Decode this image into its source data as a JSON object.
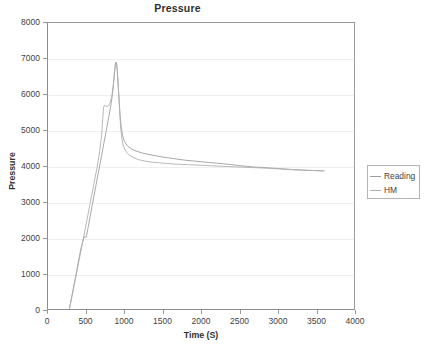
{
  "chart_data": {
    "type": "line",
    "title": "Pressure",
    "xlabel": "Time (S)",
    "ylabel": "Pressure",
    "xlim": [
      0,
      4000
    ],
    "ylim": [
      0,
      8000
    ],
    "xticks": [
      0,
      500,
      1000,
      1500,
      2000,
      2500,
      3000,
      3500,
      4000
    ],
    "yticks": [
      0,
      1000,
      2000,
      3000,
      4000,
      5000,
      6000,
      7000,
      8000
    ],
    "grid": "horizontal",
    "legend_position": "right",
    "series": [
      {
        "name": "Reading",
        "color": "#9e9e9e",
        "points": [
          [
            280,
            0
          ],
          [
            330,
            560
          ],
          [
            380,
            1120
          ],
          [
            430,
            1690
          ],
          [
            470,
            2010
          ],
          [
            500,
            2010
          ],
          [
            520,
            2230
          ],
          [
            560,
            2690
          ],
          [
            600,
            3150
          ],
          [
            650,
            3720
          ],
          [
            700,
            4290
          ],
          [
            750,
            4860
          ],
          [
            790,
            5320
          ],
          [
            820,
            5680
          ],
          [
            845,
            6050
          ],
          [
            862,
            6450
          ],
          [
            875,
            6780
          ],
          [
            885,
            6900
          ],
          [
            895,
            6880
          ],
          [
            905,
            6700
          ],
          [
            915,
            6350
          ],
          [
            928,
            5900
          ],
          [
            940,
            5480
          ],
          [
            955,
            5120
          ],
          [
            975,
            4850
          ],
          [
            1000,
            4680
          ],
          [
            1040,
            4560
          ],
          [
            1090,
            4480
          ],
          [
            1150,
            4420
          ],
          [
            1220,
            4370
          ],
          [
            1300,
            4330
          ],
          [
            1400,
            4290
          ],
          [
            1500,
            4250
          ],
          [
            1600,
            4220
          ],
          [
            1700,
            4190
          ],
          [
            1800,
            4160
          ],
          [
            1900,
            4140
          ],
          [
            2000,
            4120
          ],
          [
            2100,
            4100
          ],
          [
            2200,
            4080
          ],
          [
            2300,
            4060
          ],
          [
            2400,
            4040
          ],
          [
            2500,
            4010
          ],
          [
            2600,
            3990
          ],
          [
            2700,
            3970
          ],
          [
            2800,
            3960
          ],
          [
            2900,
            3945
          ],
          [
            3000,
            3930
          ],
          [
            3100,
            3915
          ],
          [
            3200,
            3900
          ],
          [
            3300,
            3890
          ],
          [
            3400,
            3880
          ],
          [
            3500,
            3870
          ],
          [
            3600,
            3865
          ]
        ]
      },
      {
        "name": "HM",
        "color": "#b0b0b0",
        "points": [
          [
            280,
            0
          ],
          [
            340,
            640
          ],
          [
            400,
            1300
          ],
          [
            450,
            1840
          ],
          [
            500,
            2390
          ],
          [
            550,
            2950
          ],
          [
            600,
            3500
          ],
          [
            640,
            3950
          ],
          [
            675,
            4400
          ],
          [
            700,
            4850
          ],
          [
            715,
            5300
          ],
          [
            725,
            5620
          ],
          [
            735,
            5700
          ],
          [
            750,
            5690
          ],
          [
            770,
            5660
          ],
          [
            790,
            5680
          ],
          [
            810,
            5760
          ],
          [
            830,
            5900
          ],
          [
            850,
            6180
          ],
          [
            865,
            6500
          ],
          [
            878,
            6790
          ],
          [
            888,
            6910
          ],
          [
            898,
            6840
          ],
          [
            908,
            6600
          ],
          [
            918,
            6250
          ],
          [
            930,
            5800
          ],
          [
            942,
            5340
          ],
          [
            955,
            4960
          ],
          [
            970,
            4700
          ],
          [
            990,
            4530
          ],
          [
            1020,
            4400
          ],
          [
            1060,
            4310
          ],
          [
            1110,
            4240
          ],
          [
            1180,
            4180
          ],
          [
            1260,
            4140
          ],
          [
            1350,
            4110
          ],
          [
            1450,
            4090
          ],
          [
            1550,
            4070
          ],
          [
            1650,
            4055
          ],
          [
            1750,
            4045
          ],
          [
            1850,
            4035
          ],
          [
            1950,
            4025
          ],
          [
            2050,
            4015
          ],
          [
            2150,
            4005
          ],
          [
            2250,
            3995
          ],
          [
            2350,
            3985
          ],
          [
            2450,
            3975
          ],
          [
            2550,
            3968
          ],
          [
            2650,
            3958
          ],
          [
            2750,
            3950
          ],
          [
            2850,
            3940
          ],
          [
            2950,
            3928
          ],
          [
            3050,
            3915
          ],
          [
            3150,
            3902
          ],
          [
            3250,
            3892
          ],
          [
            3350,
            3882
          ],
          [
            3450,
            3874
          ],
          [
            3550,
            3868
          ],
          [
            3620,
            3862
          ]
        ]
      }
    ]
  },
  "legend": {
    "items": [
      {
        "label": "Reading"
      },
      {
        "label": "HM"
      }
    ]
  }
}
